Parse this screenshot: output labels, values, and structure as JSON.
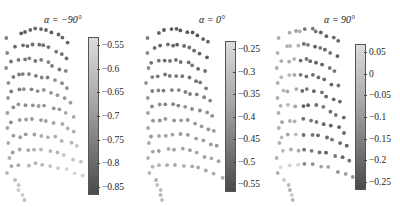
{
  "chart_data": [
    {
      "type": "scatter",
      "title": "α = −90°",
      "colorbar": {
        "ticks": [
          "-0.55",
          "-0.6",
          "-0.65",
          "-0.7",
          "-0.75",
          "-0.8",
          "-0.85"
        ],
        "range": [
          -0.88,
          -0.52
        ]
      },
      "layout": {
        "left": 0,
        "title_x": 44,
        "cbar_x": 88,
        "cbar_top": 37,
        "cbar_bottom": 195,
        "tick_x": 102
      },
      "pattern": "low-values-top-rows (dark) to high-values bottom-right (light)"
    },
    {
      "type": "scatter",
      "title": "α = 0°",
      "colorbar": {
        "ticks": [
          "-0.25",
          "-0.3",
          "-0.35",
          "-0.4",
          "-0.45",
          "-0.5",
          "-0.55"
        ],
        "range": [
          -0.58,
          -0.22
        ]
      },
      "layout": {
        "left": 140,
        "title_x": 199,
        "cbar_x": 225,
        "cbar_top": 41,
        "cbar_bottom": 192,
        "tick_x": 238
      },
      "pattern": "darker top rows, lighter bottom rows"
    },
    {
      "type": "scatter",
      "title": "α = 90°",
      "colorbar": {
        "ticks": [
          "0.05",
          "0",
          "-0.05",
          "-0.1",
          "-0.15",
          "-0.2",
          "-0.25"
        ],
        "range": [
          -0.28,
          0.07
        ]
      },
      "layout": {
        "left": 270,
        "title_x": 324,
        "cbar_x": 355,
        "cbar_top": 44,
        "cbar_bottom": 190,
        "tick_x": 369
      },
      "pattern": "light left edge, dark right-side rows"
    }
  ]
}
